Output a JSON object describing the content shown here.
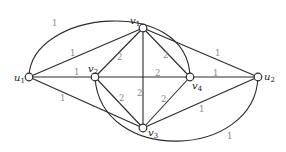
{
  "graph": {
    "nodes": [
      {
        "id": "u1",
        "label": "u",
        "sub": "1",
        "x": 29,
        "y": 77
      },
      {
        "id": "v1",
        "label": "v",
        "sub": "1",
        "x": 143,
        "y": 28
      },
      {
        "id": "v2",
        "label": "v",
        "sub": "2",
        "x": 95,
        "y": 77
      },
      {
        "id": "v4",
        "label": "v",
        "sub": "4",
        "x": 190,
        "y": 77
      },
      {
        "id": "u2",
        "label": "u",
        "sub": "2",
        "x": 258,
        "y": 77
      },
      {
        "id": "v3",
        "label": "v",
        "sub": "3",
        "x": 143,
        "y": 128
      }
    ],
    "edges": [
      {
        "from": "u1",
        "to": "v1",
        "weight": "1"
      },
      {
        "from": "u1",
        "to": "v2",
        "weight": "1"
      },
      {
        "from": "u1",
        "to": "v3",
        "weight": "1"
      },
      {
        "from": "u1",
        "to": "v4",
        "weight": "1",
        "arc": "top"
      },
      {
        "from": "v1",
        "to": "v2",
        "weight": "2"
      },
      {
        "from": "v1",
        "to": "v3",
        "weight": "2"
      },
      {
        "from": "v1",
        "to": "v4",
        "weight": "2"
      },
      {
        "from": "v1",
        "to": "u2",
        "weight": "1"
      },
      {
        "from": "v2",
        "to": "v4",
        "weight": "2"
      },
      {
        "from": "v2",
        "to": "v3",
        "weight": "2"
      },
      {
        "from": "v2",
        "to": "u2",
        "weight": "1",
        "arc": "bottom"
      },
      {
        "from": "v3",
        "to": "v4",
        "weight": "2"
      },
      {
        "from": "v3",
        "to": "u2",
        "weight": "1"
      },
      {
        "from": "v4",
        "to": "u2",
        "weight": "1"
      }
    ]
  },
  "labels": {
    "u1": {
      "main": "u",
      "sub": "1"
    },
    "u2": {
      "main": "u",
      "sub": "2"
    },
    "v1": {
      "main": "v",
      "sub": "1"
    },
    "v2": {
      "main": "v",
      "sub": "2"
    },
    "v3": {
      "main": "v",
      "sub": "3"
    },
    "v4": {
      "main": "v",
      "sub": "4"
    }
  },
  "weights": {
    "u1_v1": "1",
    "u1_v2": "1",
    "u1_v3": "1",
    "u1_v4_arc": "1",
    "v1_v2": "2",
    "v1_v3": "2",
    "v1_v4": "2",
    "v1_u2": "1",
    "v2_v4": "2",
    "v2_v3": "2",
    "v2_u2_arc": "1",
    "v3_v4": "2",
    "v3_u2": "1",
    "v4_u2": "1"
  }
}
